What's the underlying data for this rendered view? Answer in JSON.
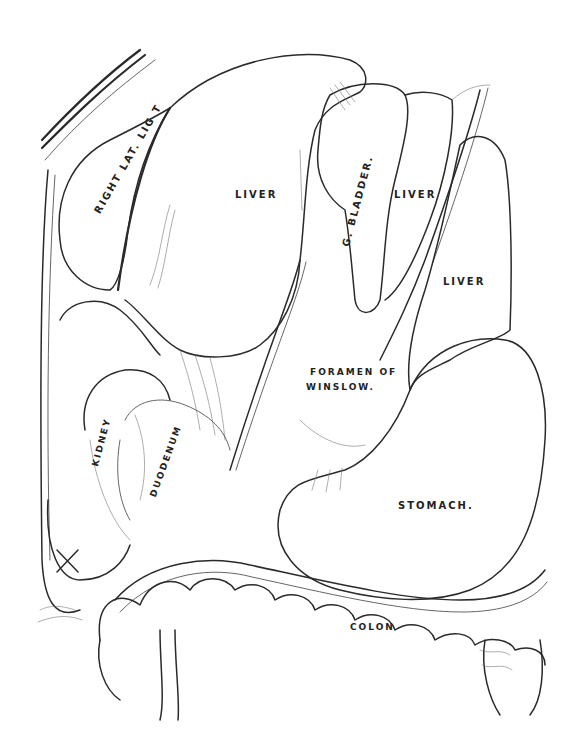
{
  "figure": {
    "type": "anatomical line drawing",
    "labels": {
      "right_lat_lig": "RIGHT LAT. LIG T",
      "liver_main": "LIVER",
      "gall_bladder": "G. BLADDER.",
      "liver_mid": "LIVER",
      "liver_right": "LIVER",
      "foramen_line1": "FORAMEN OF",
      "foramen_line2": "WINSLOW.",
      "kidney": "KIDNEY",
      "duodenum": "DUODENUM",
      "stomach": "STOMACH.",
      "colon": "COLON",
      "x_mark": "X"
    },
    "colors": {
      "ink": "#2a2a2a",
      "paper": "#ffffff"
    }
  }
}
